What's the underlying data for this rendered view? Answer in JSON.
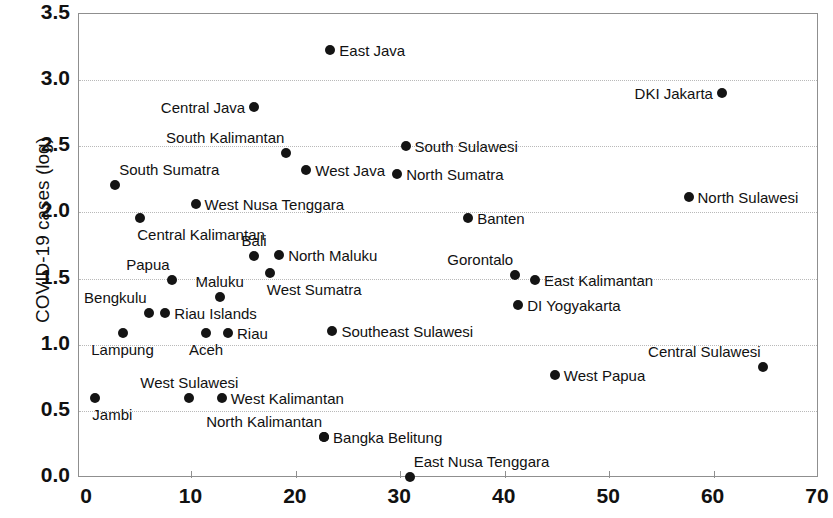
{
  "chart_data": {
    "type": "scatter",
    "title": "",
    "xlabel": "",
    "ylabel": "COVID-19 cases (log)",
    "xlim": [
      0,
      70
    ],
    "ylim": [
      0,
      3.5
    ],
    "xticks": [
      "0",
      "10",
      "20",
      "30",
      "40",
      "50",
      "60",
      "70"
    ],
    "yticks": [
      "0.0",
      "0.5",
      "1.0",
      "1.5",
      "2.0",
      "2.5",
      "3.0",
      "3.5"
    ],
    "grid": "horizontal-dotted",
    "legend": "none",
    "marker_color": "#141414",
    "points": [
      {
        "label": "East Java",
        "x": 23.3,
        "y": 3.23,
        "side": "right"
      },
      {
        "label": "DKI Jakarta",
        "x": 60.8,
        "y": 2.9,
        "side": "left"
      },
      {
        "label": "Central Java",
        "x": 16.0,
        "y": 2.8,
        "side": "left"
      },
      {
        "label": "South Sulawesi",
        "x": 30.5,
        "y": 2.5,
        "side": "right"
      },
      {
        "label": "South Kalimantan",
        "x": 19.1,
        "y": 2.45,
        "side": "up-left"
      },
      {
        "label": "West Java",
        "x": 21.0,
        "y": 2.32,
        "side": "right"
      },
      {
        "label": "North Sumatra",
        "x": 29.7,
        "y": 2.29,
        "side": "right"
      },
      {
        "label": "South Sumatra",
        "x": 2.7,
        "y": 2.21,
        "side": "up-right"
      },
      {
        "label": "North Sulawesi",
        "x": 57.6,
        "y": 2.12,
        "side": "right"
      },
      {
        "label": "West Nusa Tenggara",
        "x": 10.4,
        "y": 2.06,
        "side": "right"
      },
      {
        "label": "Central Kalimantan",
        "x": 5.1,
        "y": 1.96,
        "side": "down-right"
      },
      {
        "label": "Banten",
        "x": 36.5,
        "y": 1.96,
        "side": "right"
      },
      {
        "label": "North Maluku",
        "x": 18.4,
        "y": 1.68,
        "side": "right"
      },
      {
        "label": "Bali",
        "x": 16.0,
        "y": 1.67,
        "side": "up-center"
      },
      {
        "label": "West Sumatra",
        "x": 17.5,
        "y": 1.54,
        "side": "down-right"
      },
      {
        "label": "Gorontalo",
        "x": 41.0,
        "y": 1.53,
        "side": "up-left"
      },
      {
        "label": "Papua",
        "x": 8.1,
        "y": 1.49,
        "side": "up-left"
      },
      {
        "label": "East Kalimantan",
        "x": 42.9,
        "y": 1.49,
        "side": "right"
      },
      {
        "label": "Maluku",
        "x": 12.7,
        "y": 1.36,
        "side": "up-center"
      },
      {
        "label": "DI Yogyakarta",
        "x": 41.3,
        "y": 1.3,
        "side": "right"
      },
      {
        "label": "Bengkulu",
        "x": 5.9,
        "y": 1.24,
        "side": "up-left"
      },
      {
        "label": "Riau Islands",
        "x": 7.5,
        "y": 1.24,
        "side": "right"
      },
      {
        "label": "Southeast Sulawesi",
        "x": 23.5,
        "y": 1.1,
        "side": "right"
      },
      {
        "label": "Lampung",
        "x": 3.4,
        "y": 1.09,
        "side": "down-center"
      },
      {
        "label": "Aceh",
        "x": 11.4,
        "y": 1.09,
        "side": "down-center"
      },
      {
        "label": "Riau",
        "x": 13.5,
        "y": 1.09,
        "side": "right"
      },
      {
        "label": "Central Sulawesi",
        "x": 64.7,
        "y": 0.83,
        "side": "up-left"
      },
      {
        "label": "West Papua",
        "x": 44.8,
        "y": 0.77,
        "side": "right"
      },
      {
        "label": "Jambi",
        "x": 0.8,
        "y": 0.6,
        "side": "down-right"
      },
      {
        "label": "West Sulawesi",
        "x": 9.8,
        "y": 0.6,
        "side": "up-center"
      },
      {
        "label": "West Kalimantan",
        "x": 12.9,
        "y": 0.6,
        "side": "right"
      },
      {
        "label": "North Kalimantan",
        "x": 22.7,
        "y": 0.3,
        "side": "up-left"
      },
      {
        "label": "Bangka Belitung",
        "x": 22.7,
        "y": 0.3,
        "side": "right"
      },
      {
        "label": "East Nusa Tenggara",
        "x": 30.9,
        "y": 0.0,
        "side": "up-right"
      }
    ]
  }
}
